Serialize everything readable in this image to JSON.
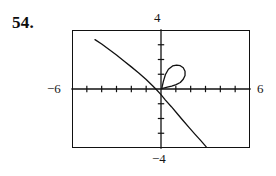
{
  "exercise": {
    "number": "54."
  },
  "viewport_labels": {
    "ymax": "4",
    "ymin": "−4",
    "xmin": "−6",
    "xmax": "6"
  },
  "chart_data": {
    "type": "line",
    "title": "",
    "subtitle": "",
    "xlabel": "",
    "ylabel": "",
    "xlim": [
      -6,
      6
    ],
    "ylim": [
      -4,
      4
    ],
    "grid": false,
    "legend": null,
    "axes": {
      "x_axis_visible": true,
      "y_axis_visible": true,
      "x_tick_interval": 1,
      "y_tick_interval": 1,
      "x_ticks": [
        -5,
        -4,
        -3,
        -2,
        -1,
        1,
        2,
        3,
        4,
        5
      ],
      "y_ticks": [
        -3,
        -2,
        -1,
        1,
        2,
        3
      ],
      "tick_style": "short-marks-on-axis"
    },
    "tick_labels": {
      "x": [
        "−6",
        "6"
      ],
      "y": [
        "−4",
        "4"
      ]
    },
    "annotations": [],
    "series": [
      {
        "name": "descending-branch",
        "type": "line",
        "style": "solid",
        "color": "#111111",
        "points": [
          [
            -4.45,
            3.35
          ],
          [
            -4.0,
            3.05
          ],
          [
            -3.5,
            2.68
          ],
          [
            -3.0,
            2.3
          ],
          [
            -2.5,
            1.9
          ],
          [
            -2.0,
            1.5
          ],
          [
            -1.5,
            1.08
          ],
          [
            -1.0,
            0.64
          ],
          [
            -0.55,
            0.2
          ],
          [
            -0.3,
            -0.05
          ],
          [
            0.0,
            -0.38
          ],
          [
            0.3,
            -0.75
          ],
          [
            0.7,
            -1.2
          ],
          [
            1.1,
            -1.68
          ],
          [
            1.5,
            -2.15
          ],
          [
            1.9,
            -2.62
          ],
          [
            2.3,
            -3.08
          ],
          [
            2.7,
            -3.52
          ],
          [
            3.05,
            -3.92
          ]
        ]
      },
      {
        "name": "closed-loop",
        "type": "closed-curve",
        "style": "solid",
        "color": "#111111",
        "points": [
          [
            0.05,
            0.02
          ],
          [
            0.16,
            0.52
          ],
          [
            0.3,
            0.98
          ],
          [
            0.5,
            1.34
          ],
          [
            0.78,
            1.56
          ],
          [
            1.05,
            1.62
          ],
          [
            1.3,
            1.58
          ],
          [
            1.5,
            1.44
          ],
          [
            1.62,
            1.2
          ],
          [
            1.62,
            0.92
          ],
          [
            1.5,
            0.66
          ],
          [
            1.3,
            0.44
          ],
          [
            1.02,
            0.3
          ],
          [
            0.72,
            0.2
          ],
          [
            0.42,
            0.12
          ],
          [
            0.18,
            0.06
          ],
          [
            0.05,
            0.02
          ]
        ]
      }
    ]
  }
}
